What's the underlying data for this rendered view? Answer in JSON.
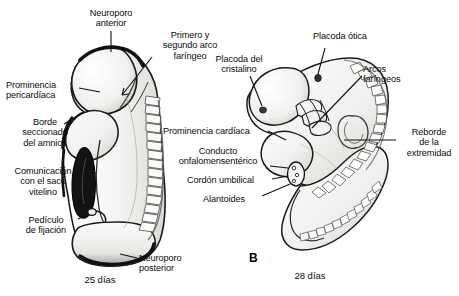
{
  "figure": {
    "background_color": "#ffffff",
    "ink_color": "#111111",
    "panels": [
      {
        "letter": "",
        "caption": "25 días",
        "caption_x": 95,
        "caption_y": 274
      },
      {
        "letter": "B",
        "caption": "28 días",
        "letter_x": 249,
        "letter_y": 251,
        "caption_x": 305,
        "caption_y": 270
      }
    ]
  },
  "labels_left_panel": [
    {
      "name": "neuroporo-anterior",
      "text": "Neuroporo\nanterior",
      "x": 78,
      "y": 8,
      "align": "center",
      "width": 66
    },
    {
      "name": "primero-y-segundo-arco-faringeo",
      "text": "Primero y\nsegundo arco\nfaríngeo",
      "x": 153,
      "y": 30,
      "align": "center",
      "width": 74
    },
    {
      "name": "prominencia-pericardiaca",
      "text": "Prominencia\npericardíaca",
      "x": 6,
      "y": 80,
      "align": "left",
      "width": 72
    },
    {
      "name": "borde-seccionado-del-amnios",
      "text": "Borde\nseccionado\ndel amnios",
      "x": 12,
      "y": 117,
      "align": "center",
      "width": 66
    },
    {
      "name": "comunicacion-con-el-saco-vitelino",
      "text": "Comunicación\ncon el saco\nvitelino",
      "x": 4,
      "y": 166,
      "align": "center",
      "width": 78
    },
    {
      "name": "pediculo-de-fijacion",
      "text": "Pedículo\nde fijación",
      "x": 15,
      "y": 215,
      "align": "center",
      "width": 62
    },
    {
      "name": "neuroporo-posterior",
      "text": "Neuroporo\nposterior",
      "x": 139,
      "y": 253,
      "align": "left",
      "width": 62
    }
  ],
  "labels_right_panel": [
    {
      "name": "placoda-del-cristalino",
      "text": "Placoda del\ncristalino",
      "x": 205,
      "y": 54,
      "align": "center",
      "width": 68
    },
    {
      "name": "placoda-otica",
      "text": "Placoda ótica",
      "x": 313,
      "y": 31,
      "align": "left",
      "width": 72
    },
    {
      "name": "arcos-faringeos",
      "text": "Arcos\nfaríngeos",
      "x": 363,
      "y": 64,
      "align": "left",
      "width": 54
    },
    {
      "name": "prominencia-cardiaca",
      "text": "Prominencia cardíaca",
      "x": 163,
      "y": 126,
      "align": "left",
      "width": 104
    },
    {
      "name": "conducto-onfalomensenterico",
      "text": "Conducto\nonfalomensentérico",
      "x": 168,
      "y": 146,
      "align": "center",
      "width": 100
    },
    {
      "name": "cordon-umbilical",
      "text": "Cordón umbilical",
      "x": 187,
      "y": 175,
      "align": "left",
      "width": 82
    },
    {
      "name": "alantoides",
      "text": "Alantoides",
      "x": 203,
      "y": 194,
      "align": "left",
      "width": 56
    },
    {
      "name": "reborde-de-la-extremidad",
      "text": "Reborde\nde la\nextremidad",
      "x": 400,
      "y": 127,
      "align": "center",
      "width": 58
    }
  ]
}
